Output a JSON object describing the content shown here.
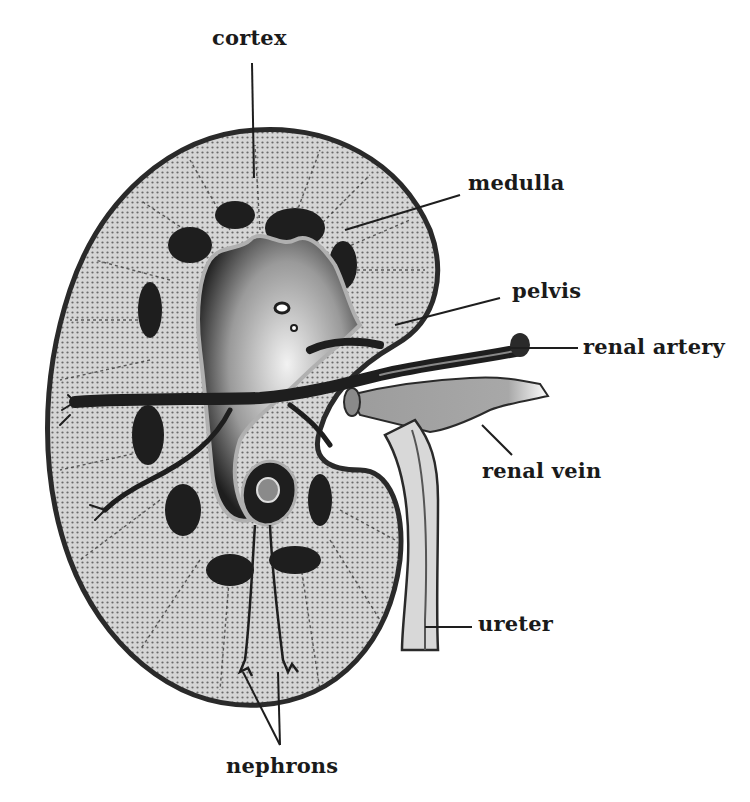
{
  "diagram": {
    "colors": {
      "background": "#ffffff",
      "outline": "#2a2a2a",
      "cortex_fill": "#cfcfcf",
      "medulla_dark": "#1e1e1e",
      "pelvis_fill": "#dcdcdc",
      "artery": "#2a2a2a",
      "vein": "#a0a0a0",
      "ureter": "#d8d8d8"
    },
    "labels": {
      "cortex": "cortex",
      "medulla": "medulla",
      "pelvis": "pelvis",
      "renal_artery": "renal artery",
      "renal_vein": "renal vein",
      "ureter": "ureter",
      "nephrons": "nephrons"
    }
  }
}
